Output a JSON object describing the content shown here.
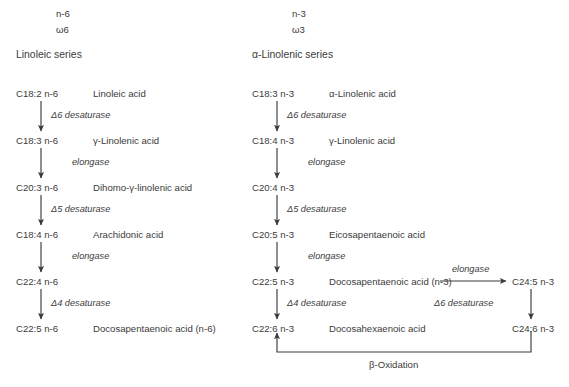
{
  "figure": {
    "left_column": {
      "omega_label_top": "n-6",
      "omega_label_bottom": "ω6",
      "series_title": "Linoleic series",
      "steps": [
        {
          "code": "C18:2 n-6",
          "acid": "Linoleic acid",
          "enzyme": "Δ6 desaturase",
          "enzyme_kind": "desaturase"
        },
        {
          "code": "C18:3 n-6",
          "acid": "γ-Linolenic acid",
          "enzyme": "elongase",
          "enzyme_kind": "elongase"
        },
        {
          "code": "C20:3 n-6",
          "acid": "Dihomo-γ-linolenic acid",
          "enzyme": "Δ5 desaturase",
          "enzyme_kind": "desaturase"
        },
        {
          "code": "C18:4 n-6",
          "acid": "Arachidonic acid",
          "enzyme": "elongase",
          "enzyme_kind": "elongase"
        },
        {
          "code": "C22:4 n-6",
          "acid": "",
          "enzyme": "Δ4 desaturase",
          "enzyme_kind": "desaturase"
        },
        {
          "code": "C22:5 n-6",
          "acid": "Docosapentaenoic acid (n-6)",
          "enzyme": "",
          "enzyme_kind": ""
        }
      ]
    },
    "right_column": {
      "omega_label_top": "n-3",
      "omega_label_bottom": "ω3",
      "series_title": "α-Linolenic series",
      "steps": [
        {
          "code": "C18:3 n-3",
          "acid": "α-Linolenic acid",
          "enzyme": "Δ6 desaturase",
          "enzyme_kind": "desaturase"
        },
        {
          "code": "C18:4 n-3",
          "acid": "γ-Linolenic acid",
          "enzyme": "elongase",
          "enzyme_kind": "elongase"
        },
        {
          "code": "C20:4 n-3",
          "acid": "",
          "enzyme": "Δ5 desaturase",
          "enzyme_kind": "desaturase"
        },
        {
          "code": "C20:5 n-3",
          "acid": "Eicosapentaenoic acid",
          "enzyme": "elongase",
          "enzyme_kind": "elongase"
        },
        {
          "code": "C22:5 n-3",
          "acid": "Docosapentaenoic acid (n-3)",
          "enzyme": "Δ4 desaturase",
          "enzyme_kind": "desaturase"
        },
        {
          "code": "C22:6 n-3",
          "acid": "Docosahexaenoic acid",
          "enzyme": "",
          "enzyme_kind": ""
        }
      ]
    },
    "side_branch": {
      "horizontal_enzyme": "elongase",
      "top_code": "C24:5 n-3",
      "vertical_enzyme": "Δ6 desaturase",
      "bottom_code": "C24:6 n-3",
      "return_label": "β-Oxidation"
    },
    "colors": {
      "text": "#3b3b3b",
      "stroke": "#3b3b3b",
      "background": "#ffffff"
    }
  }
}
